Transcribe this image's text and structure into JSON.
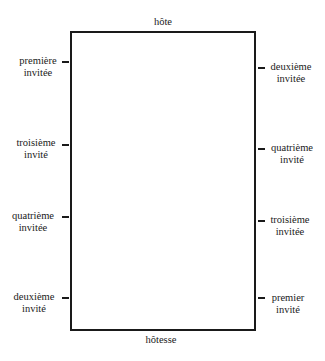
{
  "diagram": {
    "type": "seating-plan",
    "top": "hôte",
    "bottom": "hôtesse",
    "left_side": [
      {
        "line1": "première",
        "line2": "invitée"
      },
      {
        "line1": "troisième",
        "line2": "invité"
      },
      {
        "line1": "quatrième",
        "line2": "invitée"
      },
      {
        "line1": "deuxième",
        "line2": "invité"
      }
    ],
    "right_side": [
      {
        "line1": "deuxième",
        "line2": "invitée"
      },
      {
        "line1": "quatrième",
        "line2": "invité"
      },
      {
        "line1": "troisième",
        "line2": "invitée"
      },
      {
        "line1": "premier",
        "line2": "invité"
      }
    ]
  }
}
